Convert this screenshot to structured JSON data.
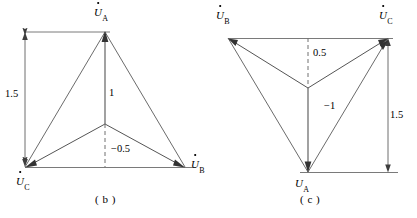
{
  "figure": {
    "type": "phasor-diagram-pair",
    "background_color": "#ffffff",
    "line_color": "#595959",
    "text_color": "#000000"
  },
  "panel_b": {
    "caption": "( b )",
    "vertices": [
      {
        "name": "U_A",
        "symbol": "U",
        "subscript": "A",
        "has_dot": true,
        "x": 105,
        "y": 32,
        "label_pos": "top"
      },
      {
        "name": "U_B",
        "symbol": "U",
        "subscript": "B",
        "has_dot": true,
        "x": 185,
        "y": 167,
        "label_pos": "right"
      },
      {
        "name": "U_C",
        "symbol": "U",
        "subscript": "C",
        "has_dot": true,
        "x": 25,
        "y": 167,
        "label_pos": "below"
      }
    ],
    "neutral_point": {
      "x": 105,
      "y": 124
    },
    "value_labels": [
      {
        "name": "u-a-magnitude",
        "text": "1",
        "x": 109,
        "y": 88
      },
      {
        "name": "neutral-offset",
        "text": "−0.5",
        "x": 111,
        "y": 145
      },
      {
        "name": "dimension-1-5",
        "text": "1.5",
        "x": 6,
        "y": 88
      }
    ],
    "dimension_line": {
      "label": "1.5",
      "x": 25,
      "y_top": 32,
      "y_bottom": 167
    },
    "dashed_segment": {
      "from_y": 124,
      "to_y": 167,
      "x": 105
    }
  },
  "panel_c": {
    "caption": "( c )",
    "vertices": [
      {
        "name": "U_B",
        "symbol": "U",
        "subscript": "B",
        "has_dot": true,
        "x": 228,
        "y": 38,
        "label_pos": "top-left"
      },
      {
        "name": "U_C",
        "symbol": "U",
        "subscript": "C",
        "has_dot": true,
        "x": 388,
        "y": 38,
        "label_pos": "top-right"
      },
      {
        "name": "U_A",
        "symbol": "U",
        "subscript": "A",
        "has_dot": false,
        "x": 308,
        "y": 172,
        "label_pos": "below"
      }
    ],
    "neutral_point": {
      "x": 308,
      "y": 88
    },
    "value_labels": [
      {
        "name": "neutral-offset",
        "text": "0.5",
        "x": 313,
        "y": 48
      },
      {
        "name": "u-a-magnitude",
        "text": "−1",
        "x": 324,
        "y": 102
      },
      {
        "name": "dimension-1-5",
        "text": "1.5",
        "x": 391,
        "y": 110
      }
    ],
    "dimension_line": {
      "label": "1.5",
      "x": 388,
      "y_top": 38,
      "y_bottom": 172
    },
    "dashed_segment": {
      "from_y": 38,
      "to_y": 88,
      "x": 308
    }
  }
}
